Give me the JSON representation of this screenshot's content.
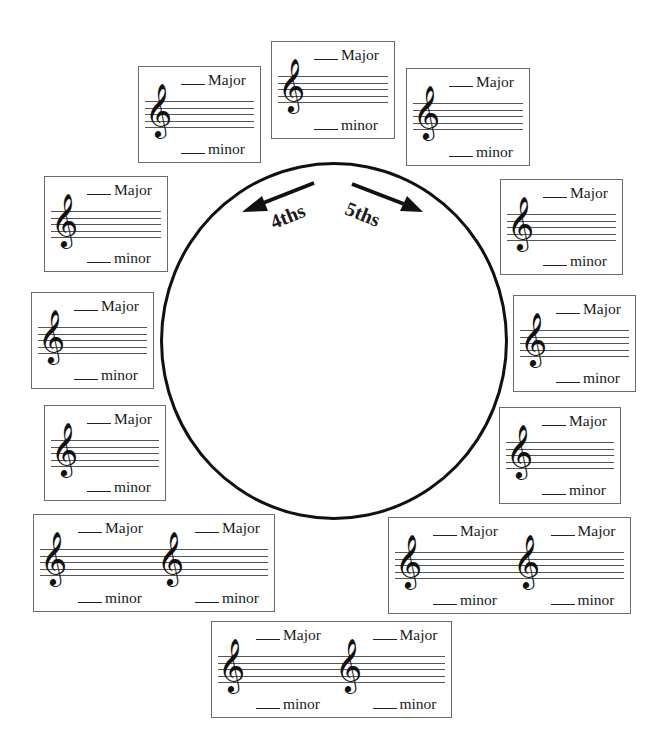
{
  "worksheet": {
    "title": "Circle of Fifths Worksheet",
    "circle": {
      "left_arrow_label": "4ths",
      "right_arrow_label": "5ths"
    },
    "labels": {
      "major": "Major",
      "minor": "minor"
    },
    "icons": {
      "clef": "𝄞"
    },
    "cards": [
      {
        "id": "top",
        "x": 271,
        "y": 41,
        "w": 124,
        "h": 98,
        "staves": 1
      },
      {
        "id": "top-left",
        "x": 138,
        "y": 66,
        "w": 123,
        "h": 97,
        "staves": 1
      },
      {
        "id": "top-right",
        "x": 406,
        "y": 68,
        "w": 124,
        "h": 98,
        "staves": 1
      },
      {
        "id": "left-1",
        "x": 44,
        "y": 176,
        "w": 124,
        "h": 96,
        "staves": 1
      },
      {
        "id": "right-1",
        "x": 500,
        "y": 179,
        "w": 123,
        "h": 96,
        "staves": 1
      },
      {
        "id": "left-2",
        "x": 31,
        "y": 292,
        "w": 123,
        "h": 97,
        "staves": 1
      },
      {
        "id": "right-2",
        "x": 513,
        "y": 295,
        "w": 123,
        "h": 97,
        "staves": 1
      },
      {
        "id": "left-3",
        "x": 44,
        "y": 405,
        "w": 122,
        "h": 96,
        "staves": 1
      },
      {
        "id": "right-3",
        "x": 499,
        "y": 407,
        "w": 122,
        "h": 97,
        "staves": 1
      },
      {
        "id": "bottom-left",
        "x": 33,
        "y": 514,
        "w": 242,
        "h": 98,
        "staves": 2
      },
      {
        "id": "bottom-right",
        "x": 388,
        "y": 517,
        "w": 243,
        "h": 97,
        "staves": 2
      },
      {
        "id": "bottom",
        "x": 211,
        "y": 621,
        "w": 241,
        "h": 97,
        "staves": 2
      }
    ]
  }
}
